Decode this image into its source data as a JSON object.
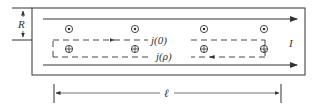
{
  "diagram": {
    "labels": {
      "radius": "R",
      "current": "I",
      "loop_top": "j(0)",
      "loop_bottom": "j(ρ)",
      "length": "ℓ"
    },
    "symbols": {
      "out_of_page": "⊙",
      "into_page": "⊕"
    },
    "colors": {
      "stroke": "#333333",
      "background": "#ffffff"
    },
    "out_of_page_x": [
      63,
      136,
      213,
      282
    ],
    "into_page_x": [
      63,
      136,
      213,
      282
    ]
  }
}
